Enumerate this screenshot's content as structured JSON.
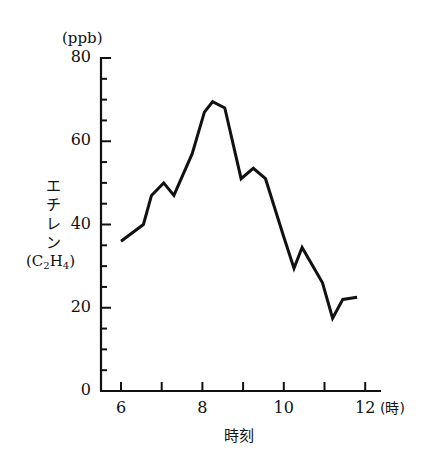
{
  "chart_data": {
    "type": "line",
    "title": "",
    "xlabel": "時刻",
    "xunit": "(時)",
    "ylabel": "エチレン",
    "ylabel_formula": {
      "base1": "C",
      "sub1": "2",
      "base2": "H",
      "sub2": "4"
    },
    "yunit": "(ppb)",
    "xlim": [
      5.6,
      12.4
    ],
    "ylim": [
      0,
      80
    ],
    "x_ticks": [
      6,
      7,
      8,
      9,
      10,
      11,
      12
    ],
    "x_tick_labels": [
      "6",
      "8",
      "10",
      "12"
    ],
    "x_tick_label_values": [
      6,
      8,
      10,
      12
    ],
    "y_ticks": [
      0,
      5,
      10,
      15,
      20,
      25,
      30,
      35,
      40,
      45,
      50,
      55,
      60,
      65,
      70,
      75,
      80
    ],
    "y_tick_labels": [
      "0",
      "20",
      "40",
      "60",
      "80"
    ],
    "y_tick_label_values": [
      0,
      20,
      40,
      60,
      80
    ],
    "grid": false,
    "legend": null,
    "series": [
      {
        "name": "エチレン (C2H4)",
        "color": "#111111",
        "x": [
          6.0,
          6.55,
          6.75,
          7.05,
          7.3,
          7.75,
          8.05,
          8.25,
          8.55,
          8.95,
          9.25,
          9.55,
          10.0,
          10.25,
          10.45,
          10.95,
          11.2,
          11.45,
          11.8
        ],
        "values": [
          36,
          40,
          47,
          50,
          47,
          57,
          67,
          69.5,
          68,
          51,
          53.5,
          51,
          37,
          29.5,
          34.5,
          26,
          17.5,
          22,
          22.5
        ]
      }
    ]
  },
  "labels": {
    "yunit": "(ppb)",
    "ylabel_chars": [
      "エ",
      "チ",
      "レ",
      "ン"
    ],
    "xunit": "(時)",
    "xlabel": "時刻"
  }
}
